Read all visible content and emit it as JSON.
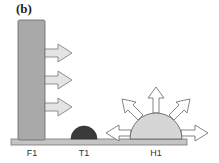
{
  "figure": {
    "panel_label": "(b)",
    "colors": {
      "pillar_fill": "#a9a9a9",
      "baseline_fill": "#c4c4c4",
      "t1_fill": "#3a3a3a",
      "h1_fill": "#d6d6d6",
      "arrow_fill": "#e4e4e4",
      "stroke": "#555555"
    },
    "labels": {
      "f1": "F1",
      "t1": "T1",
      "h1": "H1"
    }
  }
}
